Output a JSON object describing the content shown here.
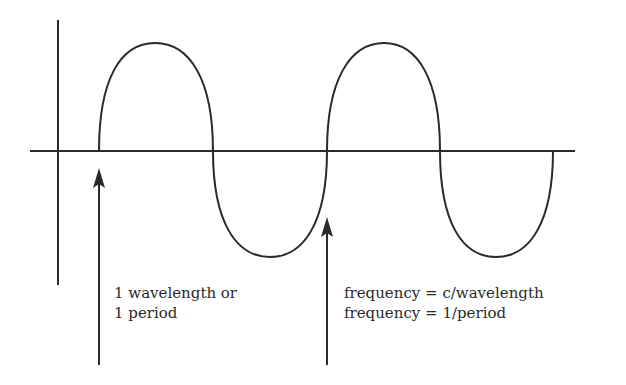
{
  "diagram": {
    "type": "sine-wave-diagram",
    "stroke_color": "#2a2a2a",
    "background": "#ffffff",
    "wave": {
      "cycles": 2,
      "start_x": 99,
      "end_x": 553,
      "baseline_y": 151,
      "peak_y": 43,
      "trough_y": 257
    },
    "axes": {
      "vertical": {
        "x": 58,
        "y1": 20,
        "y2": 285
      },
      "horizontal": {
        "y": 151,
        "x1": 30,
        "x2": 575
      }
    },
    "arrows": [
      {
        "id": "wavelength-start",
        "x": 99,
        "head_y": 168,
        "tail_y": 365
      },
      {
        "id": "wavelength-end",
        "x": 327,
        "head_y": 217,
        "tail_y": 365
      }
    ],
    "labels": {
      "left": {
        "line1": "1 wavelength or",
        "line2": "1 period"
      },
      "right": {
        "line1": "frequency = c/wavelength",
        "line2": "frequency = 1/period"
      }
    }
  }
}
